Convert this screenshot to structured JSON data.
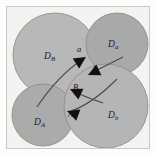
{
  "figure": {
    "background_color": "#f3f3f1",
    "frame_color": "#c9c9c9",
    "page_color": "#fdfdfd"
  },
  "disks": [
    {
      "id": "disk-DB",
      "label_main": "D",
      "label_sub": "B",
      "position": "upper-left",
      "cx": 48,
      "cy": 48,
      "r": 42,
      "fill": "#b8b8b8",
      "stroke": "#8e8e8e",
      "label_x": 37,
      "label_y": 52
    },
    {
      "id": "disk-Da",
      "label_main": "D",
      "label_sub": "a",
      "position": "upper-right",
      "cx": 110,
      "cy": 37,
      "r": 31,
      "fill": "#a9a9a9",
      "stroke": "#8e8e8e",
      "label_x": 101,
      "label_y": 40
    },
    {
      "id": "disk-DA",
      "label_main": "D",
      "label_sub": "A",
      "position": "lower-left",
      "cx": 36,
      "cy": 108,
      "r": 31,
      "fill": "#ababab",
      "stroke": "#8e8e8e",
      "label_x": 27,
      "label_y": 118
    },
    {
      "id": "disk-Db",
      "label_main": "D",
      "label_sub": "b",
      "position": "lower-right",
      "cx": 99,
      "cy": 99,
      "r": 42,
      "fill": "#b5b5b5",
      "stroke": "#8e8e8e",
      "label_x": 101,
      "label_y": 111
    }
  ],
  "point_labels": [
    {
      "id": "label-a",
      "text": "a",
      "x": 70,
      "y": 45
    },
    {
      "id": "label-b",
      "text": "b",
      "x": 86,
      "y": 65
    },
    {
      "id": "label-B",
      "text": "B",
      "x": 66,
      "y": 83
    },
    {
      "id": "label-A",
      "text": "A",
      "x": 61,
      "y": 110
    }
  ],
  "arrows": [
    {
      "id": "arrow-a",
      "label": "a",
      "description": "curve from lower-left disk up to tangency point a",
      "path": "M 30,100 C 42,82 58,64 76,52",
      "tip_x": 79,
      "tip_y": 50,
      "angle_deg": -33,
      "stroke": "#4a4a4a"
    },
    {
      "id": "arrow-b",
      "label": "b",
      "description": "curve from upper-right disk down to tangency point b",
      "path": "M 116,50 C 104,56 92,62 84,66",
      "tip_x": 81,
      "tip_y": 68,
      "angle_deg": 155,
      "stroke": "#4a4a4a"
    },
    {
      "id": "arrow-B",
      "label": "B",
      "description": "curve arriving at interstitial point B",
      "path": "M 96,96 C 84,92 74,88 66,84",
      "tip_x": 63,
      "tip_y": 82,
      "angle_deg": 205,
      "stroke": "#4a4a4a"
    },
    {
      "id": "arrow-A",
      "label": "A",
      "description": "curve from lower-right disk to interstitial point A",
      "path": "M 110,72 C 92,90 76,100 64,104",
      "tip_x": 60,
      "tip_y": 104,
      "angle_deg": 200,
      "stroke": "#4a4a4a"
    }
  ],
  "arrow_head": {
    "fill": "#111111",
    "length": 12,
    "half_width": 6
  }
}
